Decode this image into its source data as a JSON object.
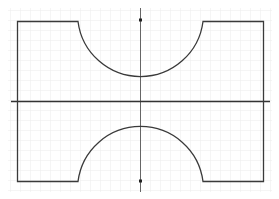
{
  "diagram": {
    "type": "geometric-shape-on-grid",
    "colors": {
      "background": "#ffffff",
      "grid": "#ebebeb",
      "shape_stroke": "#3a3a3a",
      "axis": "#333333",
      "vertical_axis": "#555555"
    },
    "grid": {
      "spacing": 10,
      "visible": true
    },
    "horizontal_axis": {
      "y": 101,
      "x1": 11,
      "x2": 270
    },
    "vertical_axis": {
      "x": 140,
      "y1": 8,
      "y2": 192
    },
    "markers": [
      {
        "name": "top-center-point",
        "x": 140,
        "y": 20
      },
      {
        "name": "bottom-center-point",
        "x": 140,
        "y": 181
      }
    ],
    "top_shape": {
      "left_x": 17,
      "right_x": 263,
      "top_y": 21,
      "bottom_y": 101,
      "arc": {
        "cx": 140,
        "cy": 21,
        "r": 63
      }
    },
    "bottom_shape": {
      "left_x": 17,
      "right_x": 263,
      "top_y": 101,
      "bottom_y": 181,
      "arc": {
        "cx": 140,
        "cy": 181,
        "r": 63
      }
    }
  }
}
